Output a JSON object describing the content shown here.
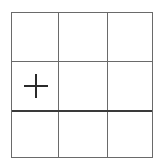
{
  "board": {
    "rows": 3,
    "cols": 3,
    "line_color": "#6a6a6a",
    "emphasized_line_color": "#3a3a3a",
    "emphasized_row_divider": 2,
    "cells": [
      [
        {
          "mark": ""
        },
        {
          "mark": ""
        },
        {
          "mark": ""
        }
      ],
      [
        {
          "mark": "plus"
        },
        {
          "mark": ""
        },
        {
          "mark": ""
        }
      ],
      [
        {
          "mark": ""
        },
        {
          "mark": ""
        },
        {
          "mark": ""
        }
      ]
    ]
  }
}
